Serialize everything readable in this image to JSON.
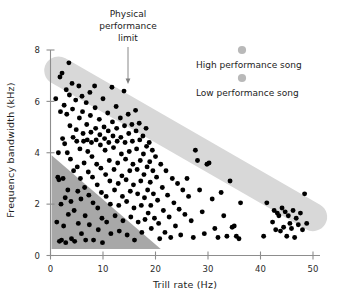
{
  "figure": {
    "name": "trill-rate-vs-frequency-bandwidth-scatter",
    "background_color": "#ffffff"
  },
  "axes": {
    "x": {
      "label": "Trill rate (Hz)",
      "ticks": [
        "0",
        "10",
        "20",
        "30",
        "40",
        "50"
      ],
      "tick_values": [
        0,
        10,
        20,
        30,
        40,
        50
      ],
      "range": [
        0,
        52
      ]
    },
    "y": {
      "label": "Frequency bandwidth (kHz)",
      "ticks": [
        "0",
        "2",
        "4",
        "6",
        "8"
      ],
      "tick_values": [
        0,
        2,
        4,
        6,
        8
      ],
      "range": [
        0,
        8.4
      ]
    }
  },
  "annotation": {
    "line1": "Physical",
    "line2": "performance",
    "line3": "limit"
  },
  "legend": {
    "items": [
      {
        "label": "High performance song",
        "marker_color": "#b9b9b9"
      },
      {
        "label": "Low performance song",
        "marker_color": "#b9b9b9"
      }
    ]
  },
  "colors": {
    "point": "#000000",
    "limit_band": "#d8d8d8",
    "low_performance_region": "#a8a8a8",
    "axis": "#8d8d8d",
    "text": "#1c1c1c"
  },
  "chart_data": {
    "type": "scatter",
    "title": "",
    "xlabel": "Trill rate (Hz)",
    "ylabel": "Frequency bandwidth (kHz)",
    "xlim": [
      0,
      52
    ],
    "ylim": [
      0,
      8.4
    ],
    "grid": false,
    "legend_position": "top-right",
    "annotations": [
      {
        "text": "Physical performance limit",
        "points_to_x": 15.0,
        "points_to_y": 6.6
      }
    ],
    "shapes": [
      {
        "name": "physical-performance-limit-band",
        "type": "thick-line",
        "color": "#d8d8d8",
        "x1": 1.5,
        "y1": 7.2,
        "x2": 50.0,
        "y2": 1.5,
        "thickness_khz": 1.1
      },
      {
        "name": "low-performance-region",
        "type": "triangle",
        "color": "#a8a8a8",
        "vertices": [
          [
            0.2,
            3.9
          ],
          [
            0.2,
            0.25
          ],
          [
            21.0,
            0.25
          ]
        ]
      }
    ],
    "series": [
      {
        "name": "songs",
        "marker": "circle",
        "color": "#000000",
        "points": [
          [
            1.0,
            6.1
          ],
          [
            1.2,
            1.3
          ],
          [
            1.4,
            3.05
          ],
          [
            1.5,
            4.0
          ],
          [
            1.6,
            2.95
          ],
          [
            1.7,
            0.55
          ],
          [
            1.8,
            6.95
          ],
          [
            1.9,
            5.6
          ],
          [
            2.0,
            2.0
          ],
          [
            2.1,
            0.6
          ],
          [
            2.2,
            7.1
          ],
          [
            2.3,
            4.55
          ],
          [
            2.4,
            3.0
          ],
          [
            2.5,
            1.15
          ],
          [
            2.6,
            5.85
          ],
          [
            2.7,
            4.35
          ],
          [
            2.8,
            2.25
          ],
          [
            2.9,
            0.5
          ],
          [
            3.0,
            6.45
          ],
          [
            3.1,
            5.5
          ],
          [
            3.2,
            4.0
          ],
          [
            3.3,
            2.55
          ],
          [
            3.4,
            1.6
          ],
          [
            3.5,
            7.5
          ],
          [
            3.6,
            6.25
          ],
          [
            3.7,
            5.05
          ],
          [
            3.8,
            3.75
          ],
          [
            3.9,
            2.1
          ],
          [
            4.0,
            0.65
          ],
          [
            4.1,
            6.7
          ],
          [
            4.2,
            5.7
          ],
          [
            4.3,
            4.6
          ],
          [
            4.4,
            3.3
          ],
          [
            4.5,
            1.75
          ],
          [
            4.6,
            0.55
          ],
          [
            4.8,
            6.05
          ],
          [
            4.9,
            4.9
          ],
          [
            5.0,
            4.45
          ],
          [
            5.1,
            3.45
          ],
          [
            5.2,
            2.5
          ],
          [
            5.3,
            1.25
          ],
          [
            5.4,
            6.6
          ],
          [
            5.5,
            5.35
          ],
          [
            5.6,
            4.15
          ],
          [
            5.7,
            3.0
          ],
          [
            5.8,
            2.2
          ],
          [
            5.9,
            0.85
          ],
          [
            6.0,
            6.2
          ],
          [
            6.1,
            5.6
          ],
          [
            6.2,
            4.75
          ],
          [
            6.3,
            4.45
          ],
          [
            6.4,
            3.6
          ],
          [
            6.5,
            2.65
          ],
          [
            6.6,
            1.55
          ],
          [
            6.7,
            0.6
          ],
          [
            6.8,
            5.95
          ],
          [
            6.9,
            5.1
          ],
          [
            7.0,
            4.5
          ],
          [
            7.1,
            4.05
          ],
          [
            7.2,
            3.25
          ],
          [
            7.3,
            2.35
          ],
          [
            7.4,
            1.2
          ],
          [
            7.5,
            6.35
          ],
          [
            7.6,
            5.45
          ],
          [
            7.7,
            4.8
          ],
          [
            7.8,
            4.4
          ],
          [
            7.9,
            3.85
          ],
          [
            8.0,
            3.05
          ],
          [
            8.1,
            2.05
          ],
          [
            8.2,
            0.6
          ],
          [
            8.4,
            6.6
          ],
          [
            8.5,
            5.75
          ],
          [
            8.6,
            4.95
          ],
          [
            8.7,
            4.5
          ],
          [
            8.8,
            3.55
          ],
          [
            8.9,
            2.75
          ],
          [
            9.0,
            1.85
          ],
          [
            9.1,
            1.0
          ],
          [
            9.3,
            5.3
          ],
          [
            9.4,
            4.7
          ],
          [
            9.5,
            4.3
          ],
          [
            9.6,
            3.4
          ],
          [
            9.7,
            2.45
          ],
          [
            9.8,
            1.45
          ],
          [
            9.9,
            0.5
          ],
          [
            10.0,
            6.1
          ],
          [
            10.2,
            5.0
          ],
          [
            10.3,
            4.55
          ],
          [
            10.4,
            4.1
          ],
          [
            10.5,
            3.15
          ],
          [
            10.6,
            2.3
          ],
          [
            10.7,
            1.3
          ],
          [
            10.9,
            5.55
          ],
          [
            11.0,
            4.85
          ],
          [
            11.1,
            4.4
          ],
          [
            11.2,
            3.7
          ],
          [
            11.3,
            2.9
          ],
          [
            11.4,
            2.0
          ],
          [
            11.5,
            0.85
          ],
          [
            11.7,
            6.55
          ],
          [
            11.8,
            5.2
          ],
          [
            11.9,
            4.65
          ],
          [
            12.0,
            4.2
          ],
          [
            12.1,
            3.35
          ],
          [
            12.2,
            2.55
          ],
          [
            12.3,
            1.55
          ],
          [
            12.5,
            5.8
          ],
          [
            12.6,
            4.95
          ],
          [
            12.7,
            4.45
          ],
          [
            12.8,
            3.6
          ],
          [
            12.9,
            2.8
          ],
          [
            13.0,
            1.95
          ],
          [
            13.1,
            0.95
          ],
          [
            13.3,
            5.35
          ],
          [
            13.4,
            4.6
          ],
          [
            13.5,
            3.95
          ],
          [
            13.6,
            3.1
          ],
          [
            13.7,
            2.3
          ],
          [
            13.8,
            1.35
          ],
          [
            14.0,
            6.4
          ],
          [
            14.1,
            5.05
          ],
          [
            14.2,
            4.4
          ],
          [
            14.3,
            3.75
          ],
          [
            14.4,
            2.95
          ],
          [
            14.5,
            2.1
          ],
          [
            14.6,
            0.8
          ],
          [
            14.8,
            5.5
          ],
          [
            14.9,
            4.75
          ],
          [
            15.0,
            4.05
          ],
          [
            15.1,
            3.3
          ],
          [
            15.2,
            2.5
          ],
          [
            15.3,
            1.5
          ],
          [
            15.5,
            5.1
          ],
          [
            15.6,
            4.45
          ],
          [
            15.7,
            3.55
          ],
          [
            15.8,
            2.75
          ],
          [
            15.9,
            1.85
          ],
          [
            16.0,
            0.6
          ],
          [
            16.2,
            5.65
          ],
          [
            16.3,
            4.85
          ],
          [
            16.4,
            4.15
          ],
          [
            16.5,
            3.35
          ],
          [
            16.6,
            2.4
          ],
          [
            16.7,
            1.3
          ],
          [
            16.9,
            5.15
          ],
          [
            17.0,
            4.5
          ],
          [
            17.1,
            3.7
          ],
          [
            17.2,
            2.9
          ],
          [
            17.3,
            1.95
          ],
          [
            17.4,
            0.9
          ],
          [
            17.6,
            4.65
          ],
          [
            17.7,
            3.95
          ],
          [
            17.8,
            3.15
          ],
          [
            17.9,
            2.25
          ],
          [
            18.0,
            1.4
          ],
          [
            18.2,
            4.95
          ],
          [
            18.3,
            4.25
          ],
          [
            18.4,
            3.45
          ],
          [
            18.5,
            2.55
          ],
          [
            18.6,
            1.65
          ],
          [
            18.8,
            4.4
          ],
          [
            18.9,
            3.65
          ],
          [
            19.0,
            2.85
          ],
          [
            19.1,
            1.95
          ],
          [
            19.2,
            1.05
          ],
          [
            19.4,
            4.1
          ],
          [
            19.5,
            3.3
          ],
          [
            19.6,
            2.4
          ],
          [
            19.8,
            1.45
          ],
          [
            20.0,
            3.85
          ],
          [
            20.2,
            3.05
          ],
          [
            20.4,
            2.15
          ],
          [
            20.6,
            1.25
          ],
          [
            20.8,
            0.65
          ],
          [
            21.0,
            3.55
          ],
          [
            21.3,
            2.65
          ],
          [
            21.5,
            1.75
          ],
          [
            21.8,
            0.9
          ],
          [
            22.0,
            3.3
          ],
          [
            22.3,
            2.35
          ],
          [
            22.6,
            1.5
          ],
          [
            22.9,
            0.7
          ],
          [
            23.2,
            3.0
          ],
          [
            23.5,
            2.05
          ],
          [
            23.8,
            1.15
          ],
          [
            24.2,
            2.8
          ],
          [
            24.5,
            1.8
          ],
          [
            24.8,
            0.8
          ],
          [
            25.2,
            2.55
          ],
          [
            25.6,
            1.6
          ],
          [
            26.0,
            3.0
          ],
          [
            26.3,
            2.3
          ],
          [
            26.8,
            1.35
          ],
          [
            27.2,
            0.7
          ],
          [
            27.6,
            4.1
          ],
          [
            28.0,
            3.7
          ],
          [
            28.4,
            2.55
          ],
          [
            28.9,
            1.7
          ],
          [
            29.3,
            0.85
          ],
          [
            29.8,
            3.55
          ],
          [
            30.2,
            3.6
          ],
          [
            30.8,
            2.2
          ],
          [
            31.3,
            1.05
          ],
          [
            31.9,
            0.7
          ],
          [
            32.5,
            2.45
          ],
          [
            33.0,
            1.55
          ],
          [
            33.6,
            0.75
          ],
          [
            34.2,
            2.9
          ],
          [
            34.6,
            1.1
          ],
          [
            35.0,
            1.15
          ],
          [
            35.4,
            0.75
          ],
          [
            35.9,
            0.65
          ],
          [
            36.2,
            2.05
          ],
          [
            40.6,
            0.75
          ],
          [
            41.2,
            2.05
          ],
          [
            42.3,
            1.3
          ],
          [
            42.6,
            1.75
          ],
          [
            42.9,
            1.0
          ],
          [
            43.2,
            1.65
          ],
          [
            43.5,
            1.55
          ],
          [
            43.8,
            0.95
          ],
          [
            44.1,
            1.85
          ],
          [
            44.4,
            1.1
          ],
          [
            44.7,
            1.7
          ],
          [
            45.0,
            0.75
          ],
          [
            45.3,
            1.55
          ],
          [
            45.6,
            1.25
          ],
          [
            45.9,
            1.05
          ],
          [
            46.2,
            1.75
          ],
          [
            46.5,
            0.7
          ],
          [
            46.8,
            1.45
          ],
          [
            47.2,
            1.2
          ],
          [
            47.6,
            1.65
          ],
          [
            48.0,
            1.0
          ],
          [
            48.4,
            2.4
          ],
          [
            48.8,
            1.25
          ]
        ]
      }
    ]
  }
}
